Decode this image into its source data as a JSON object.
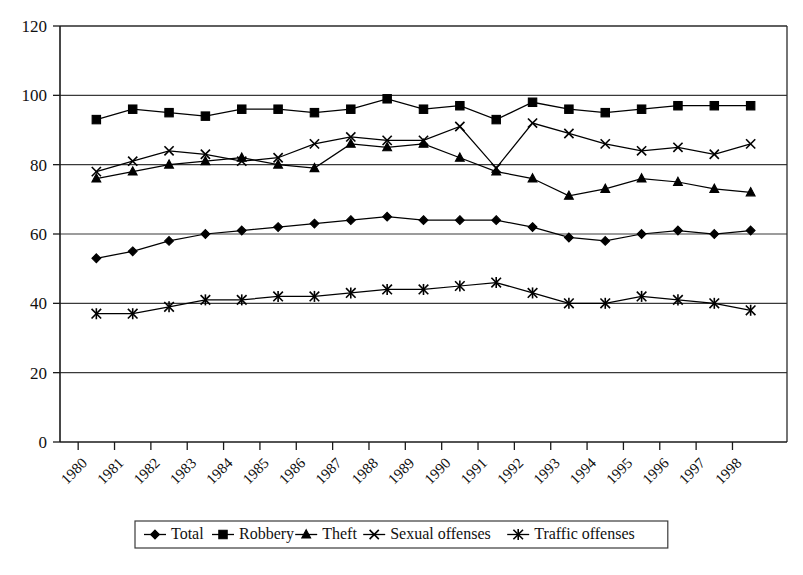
{
  "chart_data": {
    "type": "line",
    "title": "",
    "xlabel": "",
    "ylabel": "",
    "ylim": [
      0,
      120
    ],
    "ytick_step": 20,
    "grid": true,
    "grid_axis": "y",
    "legend_position": "bottom",
    "categories": [
      "1980",
      "1981",
      "1982",
      "1983",
      "1984",
      "1985",
      "1986",
      "1987",
      "1988",
      "1989",
      "1990",
      "1991",
      "1992",
      "1993",
      "1994",
      "1995",
      "1996",
      "1997",
      "1998"
    ],
    "yticks": [
      "0",
      "20",
      "40",
      "60",
      "80",
      "100",
      "120"
    ],
    "series": [
      {
        "name": "Total",
        "marker": "diamond",
        "values": [
          53,
          55,
          58,
          60,
          61,
          62,
          63,
          64,
          65,
          64,
          64,
          64,
          62,
          59,
          58,
          60,
          61,
          60,
          61
        ]
      },
      {
        "name": "Robbery",
        "marker": "square",
        "values": [
          93,
          96,
          95,
          94,
          96,
          96,
          95,
          96,
          99,
          96,
          97,
          93,
          98,
          96,
          95,
          96,
          97,
          97,
          97
        ]
      },
      {
        "name": "Theft",
        "marker": "triangle",
        "values": [
          76,
          78,
          80,
          81,
          82,
          80,
          79,
          86,
          85,
          86,
          82,
          78,
          76,
          71,
          73,
          76,
          75,
          73,
          72
        ]
      },
      {
        "name": "Sexual offenses",
        "marker": "cross",
        "values": [
          78,
          81,
          84,
          83,
          81,
          82,
          86,
          88,
          87,
          87,
          91,
          79,
          92,
          89,
          86,
          84,
          85,
          83,
          86
        ]
      },
      {
        "name": "Traffic offenses",
        "marker": "asterisk",
        "values": [
          37,
          37,
          39,
          41,
          41,
          42,
          42,
          43,
          44,
          44,
          45,
          46,
          43,
          40,
          40,
          42,
          41,
          40,
          38
        ]
      }
    ]
  },
  "legend": {
    "items": [
      {
        "label": "Total",
        "marker": "diamond"
      },
      {
        "label": "Robbery",
        "marker": "square"
      },
      {
        "label": "Theft",
        "marker": "triangle"
      },
      {
        "label": "Sexual offenses",
        "marker": "cross"
      },
      {
        "label": "Traffic offenses",
        "marker": "asterisk"
      }
    ]
  },
  "colors": {
    "ink": "#000000",
    "grid": "#3a3a3a",
    "frame": "#2a2a2a",
    "background": "#ffffff"
  }
}
